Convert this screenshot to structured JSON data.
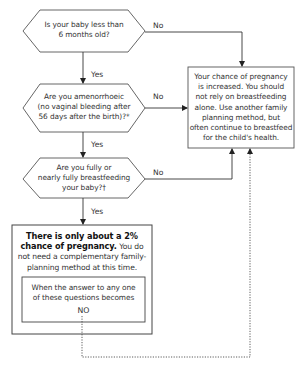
{
  "diagram": {
    "questions": [
      {
        "id": "q1",
        "line1": "Is your baby less than",
        "line2": "6 months old?",
        "line3": "",
        "yes_label": "Yes",
        "no_label": "No"
      },
      {
        "id": "q2",
        "line1": "Are you amenorrhoeic",
        "line2": "(no vaginal bleeding after",
        "line3": "56 days after the birth)?*",
        "yes_label": "Yes",
        "no_label": "No"
      },
      {
        "id": "q3",
        "line1": "Are you fully or",
        "line2": "nearly fully breastfeeding",
        "line3": "your baby?†",
        "yes_label": "Yes",
        "no_label": "No"
      }
    ],
    "increased_box": {
      "lines": [
        "Your chance of pregnancy",
        "is increased. You should",
        "not rely on breastfeeding",
        "alone. Use another family",
        "planning method, but",
        "often continue to breastfeed",
        "for the child's health."
      ]
    },
    "low_chance_box": {
      "bold_line1": "There is only about a 2%",
      "bold_line2": "chance of pregnancy.",
      "rest_line2": " You do",
      "line3": "not need a complementary family-",
      "line4": "planning method at this time.",
      "inner": {
        "line1": "When the answer to any one",
        "line2": "of these questions becomes",
        "line3": "NO"
      }
    },
    "colors": {
      "line": "#3a3a3a",
      "box_border": "#555555",
      "text": "#333333"
    }
  }
}
